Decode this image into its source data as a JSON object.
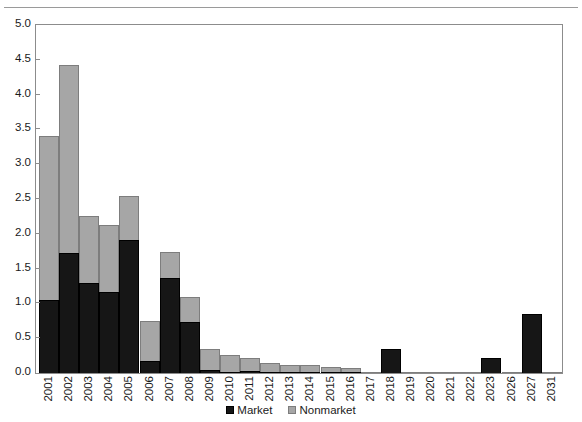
{
  "chart_data": {
    "type": "bar",
    "stacked": true,
    "title": "",
    "subtitle": "",
    "xlabel": "",
    "ylabel": "",
    "ylim": [
      0.0,
      5.0
    ],
    "ytick_step": 0.5,
    "ytick_labels": [
      "5.0",
      "4.5",
      "4.0",
      "3.5",
      "3.0",
      "2.5",
      "2.0",
      "1.5",
      "1.0",
      "0.5",
      "0.0"
    ],
    "ytick_values": [
      5.0,
      4.5,
      4.0,
      3.5,
      3.0,
      2.5,
      2.0,
      1.5,
      1.0,
      0.5,
      0.0
    ],
    "grid": false,
    "legend_position": "bottom-center",
    "categories": [
      "2001",
      "2002",
      "2003",
      "2004",
      "2005",
      "2006",
      "2007",
      "2008",
      "2009",
      "2010",
      "2011",
      "2012",
      "2013",
      "2014",
      "2015",
      "2016",
      "2017",
      "2018",
      "2019",
      "2020",
      "2021",
      "2022",
      "2023",
      "2026",
      "2027",
      "2031"
    ],
    "series": [
      {
        "name": "Market",
        "color": "#161616",
        "values": [
          1.05,
          1.73,
          1.29,
          1.17,
          1.91,
          0.17,
          1.36,
          0.73,
          0.04,
          0.02,
          0.03,
          0.02,
          0.02,
          0.02,
          0.01,
          0.01,
          0.0,
          0.34,
          0.0,
          0.0,
          0.0,
          0.0,
          0.21,
          0.0,
          0.85,
          0.0
        ]
      },
      {
        "name": "Nonmarket",
        "color": "#a6a6a6",
        "values": [
          2.36,
          2.69,
          0.96,
          0.95,
          0.64,
          0.58,
          0.38,
          0.36,
          0.31,
          0.24,
          0.19,
          0.12,
          0.09,
          0.09,
          0.07,
          0.06,
          0.02,
          0.0,
          0.01,
          0.01,
          0.01,
          0.01,
          0.0,
          0.01,
          0.0,
          0.01
        ]
      }
    ],
    "totals": [
      3.41,
      4.42,
      2.25,
      2.12,
      2.55,
      0.75,
      1.74,
      1.09,
      0.35,
      0.26,
      0.22,
      0.14,
      0.11,
      0.11,
      0.08,
      0.07,
      0.02,
      0.34,
      0.01,
      0.01,
      0.01,
      0.01,
      0.21,
      0.01,
      0.85,
      0.01
    ]
  },
  "legend": {
    "items": [
      {
        "label": "Market",
        "swatch": "market-swatch"
      },
      {
        "label": "Nonmarket",
        "swatch": "nonmarket-swatch"
      }
    ]
  }
}
